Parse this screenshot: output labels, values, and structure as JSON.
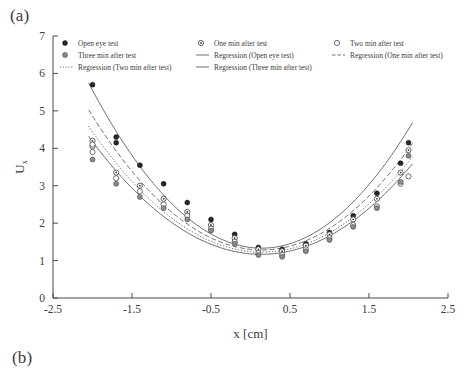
{
  "figure": {
    "panel_a_label": "(a)",
    "panel_b_label": "(b)"
  },
  "chart_data": {
    "type": "scatter",
    "title": "",
    "xlabel": "x [cm]",
    "ylabel": "U",
    "ylabel_sub": "x",
    "xlim": [
      -2.5,
      2.5
    ],
    "ylim": [
      0,
      7
    ],
    "xticks": [
      -2.5,
      -1.5,
      -0.5,
      0.5,
      1.5,
      2.5
    ],
    "xtick_labels": [
      "-2.5",
      "-1.5",
      "-0.5",
      "0.5",
      "1.5",
      "2.5"
    ],
    "yticks": [
      0,
      1,
      2,
      3,
      4,
      5,
      6,
      7
    ],
    "ytick_labels": [
      "0",
      "1",
      "2",
      "3",
      "4",
      "5",
      "6",
      "7"
    ],
    "grid": false,
    "legend_position": "top-inside",
    "legend": [
      {
        "label": "Open eye test",
        "marker": "filled-circle",
        "kind": "scatter"
      },
      {
        "label": "One min after test",
        "marker": "dotted-circle",
        "kind": "scatter"
      },
      {
        "label": "Two min after test",
        "marker": "open-circle",
        "kind": "scatter"
      },
      {
        "label": "Three min after test",
        "marker": "grey-circle",
        "kind": "scatter"
      },
      {
        "label": "Regression (Open eye test)",
        "marker": "solid-line",
        "kind": "line"
      },
      {
        "label": "Regression (One min after test)",
        "marker": "dashed-line",
        "kind": "line"
      },
      {
        "label": "Regression (Two min after test)",
        "marker": "dotted-line",
        "kind": "line"
      },
      {
        "label": "Regression (Three min after test)",
        "marker": "solid-line",
        "kind": "line"
      }
    ],
    "series": [
      {
        "name": "Open eye test",
        "marker": "filled-circle",
        "x": [
          -2.0,
          -1.7,
          -1.7,
          -1.4,
          -1.1,
          -0.8,
          -0.5,
          -0.2,
          0.1,
          0.4,
          0.7,
          1.0,
          1.3,
          1.6,
          1.9,
          2.0
        ],
        "y": [
          5.7,
          4.3,
          4.15,
          3.55,
          3.05,
          2.55,
          2.1,
          1.7,
          1.35,
          1.3,
          1.45,
          1.75,
          2.2,
          2.8,
          3.6,
          4.15
        ]
      },
      {
        "name": "One min after test",
        "marker": "dotted-circle",
        "x": [
          -2.0,
          -2.0,
          -1.7,
          -1.4,
          -1.1,
          -0.8,
          -0.5,
          -0.2,
          0.1,
          0.4,
          0.7,
          1.0,
          1.3,
          1.6,
          1.9,
          2.0
        ],
        "y": [
          4.2,
          4.05,
          3.35,
          3.0,
          2.65,
          2.3,
          1.95,
          1.6,
          1.3,
          1.25,
          1.4,
          1.7,
          2.1,
          2.65,
          3.35,
          3.95
        ]
      },
      {
        "name": "Two min after test",
        "marker": "open-circle",
        "x": [
          -2.0,
          -2.0,
          -1.7,
          -1.4,
          -1.1,
          -0.8,
          -0.5,
          -0.2,
          0.1,
          0.4,
          0.7,
          1.0,
          1.3,
          1.6,
          1.9,
          2.0
        ],
        "y": [
          4.1,
          3.9,
          3.2,
          2.85,
          2.5,
          2.2,
          1.85,
          1.5,
          1.2,
          1.15,
          1.3,
          1.6,
          1.95,
          2.45,
          3.05,
          3.25
        ]
      },
      {
        "name": "Three min after test",
        "marker": "grey-circle",
        "x": [
          -2.0,
          -1.7,
          -1.4,
          -1.1,
          -0.8,
          -0.5,
          -0.2,
          0.1,
          0.4,
          0.7,
          1.0,
          1.3,
          1.6,
          1.9,
          2.0
        ],
        "y": [
          3.7,
          3.05,
          2.7,
          2.4,
          2.1,
          1.8,
          1.45,
          1.15,
          1.1,
          1.25,
          1.55,
          1.9,
          2.4,
          3.1,
          3.8
        ]
      }
    ],
    "regressions": [
      {
        "name": "Regression (Open eye test)",
        "style": "solid",
        "a": 0.92,
        "b": -0.26,
        "c": 1.35,
        "xmin": -2.05,
        "xmax": 2.05
      },
      {
        "name": "Regression (One min after test)",
        "style": "dashed",
        "a": 0.78,
        "b": -0.22,
        "c": 1.3,
        "xmin": -2.05,
        "xmax": 2.05
      },
      {
        "name": "Regression (Two min after test)",
        "style": "dotted",
        "a": 0.7,
        "b": -0.2,
        "c": 1.24,
        "xmin": -2.05,
        "xmax": 2.05
      },
      {
        "name": "Regression (Three min after test)",
        "style": "solid",
        "a": 0.66,
        "b": -0.18,
        "c": 1.18,
        "xmin": -2.05,
        "xmax": 2.05
      }
    ]
  }
}
